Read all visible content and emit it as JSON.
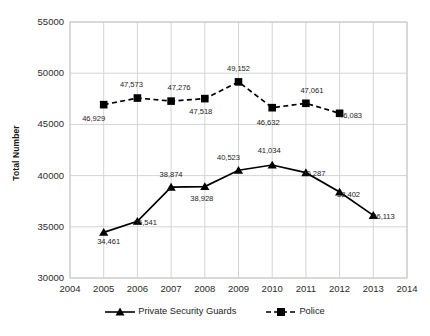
{
  "chart_data": {
    "type": "line",
    "title": "",
    "subtitle": "",
    "xlabel": "",
    "ylabel": "Total Number",
    "x": [
      2004,
      2005,
      2006,
      2007,
      2008,
      2009,
      2010,
      2011,
      2012,
      2013,
      2014
    ],
    "xtick_labels": [
      "2004",
      "2005",
      "2006",
      "2007",
      "2008",
      "2009",
      "2010",
      "2011",
      "2012",
      "2013",
      "2014"
    ],
    "xlim": [
      2004,
      2014
    ],
    "ylim": [
      30000,
      55000
    ],
    "ytick_labels": [
      "30000",
      "35000",
      "40000",
      "45000",
      "50000",
      "55000"
    ],
    "ytick_values": [
      30000,
      35000,
      40000,
      45000,
      50000,
      55000
    ],
    "grid": "vertical and horizontal light gray gridlines",
    "legend_position": "bottom-center",
    "series": [
      {
        "name": "Private Security Guards",
        "marker": "triangle",
        "line_style": "solid",
        "color": "#000000",
        "x": [
          2005,
          2006,
          2007,
          2008,
          2009,
          2010,
          2011,
          2012,
          2013
        ],
        "values": [
          34461,
          35541,
          38874,
          38928,
          40523,
          41034,
          40287,
          38402,
          36113
        ],
        "point_labels": [
          "34,461",
          "35,541",
          "38,874",
          "38,928",
          "40,523",
          "41,034",
          "40,287",
          "38,402",
          "36,113"
        ]
      },
      {
        "name": "Police",
        "marker": "square",
        "line_style": "dashed",
        "color": "#000000",
        "x": [
          2005,
          2006,
          2007,
          2008,
          2009,
          2010,
          2011,
          2012
        ],
        "values": [
          46929,
          47573,
          47276,
          47518,
          49152,
          46632,
          47061,
          46083
        ],
        "point_labels": [
          "46,929",
          "47,573",
          "47,276",
          "47,518",
          "49,152",
          "46,632",
          "47,061",
          "46,083"
        ]
      }
    ]
  },
  "legend": {
    "items": [
      {
        "label": "Private Security Guards",
        "marker": "triangle-marker-icon"
      },
      {
        "label": "Police",
        "marker": "square-marker-icon"
      }
    ]
  },
  "colors": {
    "series": "#000000",
    "grid": "#d4d4d4",
    "plot_border": "#c8c8c8",
    "text": "#1d1d1d",
    "background": "#ffffff"
  }
}
